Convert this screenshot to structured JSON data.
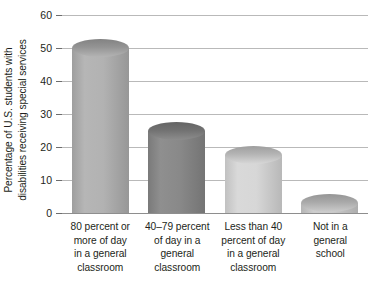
{
  "chart_data": {
    "type": "bar",
    "title": "",
    "xlabel": "",
    "ylabel": "Percentage of U.S. students with disabilities receiving special services",
    "ylabel_lines": [
      "Percentage of U.S. students with",
      "disabilities receiving special services"
    ],
    "categories": [
      "80 percent or more of day in a general classroom",
      "40–79 percent of day in a general classroom",
      "Less than 40 percent of day in a general classroom",
      "Not in a general school"
    ],
    "category_lines": [
      [
        "80 percent or",
        "more of day",
        "in a general",
        "classroom"
      ],
      [
        "40–79 percent",
        "of day in a",
        "general",
        "classroom"
      ],
      [
        "Less than 40",
        "percent of day",
        "in a general",
        "classroom"
      ],
      [
        "Not in a",
        "general",
        "school"
      ]
    ],
    "values": [
      50,
      25,
      17.5,
      3
    ],
    "ylim": [
      0,
      60
    ],
    "yticks": [
      0,
      10,
      20,
      30,
      40,
      50,
      60
    ],
    "ytick_labels": [
      "0",
      "10",
      "20",
      "30",
      "40",
      "50",
      "60"
    ],
    "grid": true,
    "legend": "none",
    "bar_colors": [
      "#b0b0b0",
      "#878787",
      "#d6d6d6",
      "#c9c9c9"
    ],
    "gridline_color": "#b9b9b9",
    "axis_color": "#8e8e8e",
    "text_color": "#231f20"
  }
}
